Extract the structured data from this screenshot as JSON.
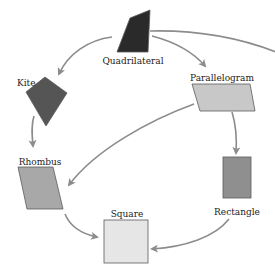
{
  "diagram": {
    "type": "quadrilateral-hierarchy",
    "colors": {
      "quadrilateral": "#2a2a2a",
      "kite": "#555555",
      "parallelogram": "#c8c8c8",
      "rhombus": "#a8a8a8",
      "rectangle": "#8f8f8f",
      "square": "#e6e6e6",
      "arrow": "#8c8c8c"
    },
    "nodes": {
      "quadrilateral": {
        "label": "Quadrilateral"
      },
      "kite": {
        "label": "Kite"
      },
      "parallelogram": {
        "label": "Parallelogram"
      },
      "rhombus": {
        "label": "Rhombus"
      },
      "rectangle": {
        "label": "Rectangle"
      },
      "square": {
        "label": "Square"
      }
    },
    "edges": [
      {
        "from": "Quadrilateral",
        "to": "Kite"
      },
      {
        "from": "Quadrilateral",
        "to": "Parallelogram"
      },
      {
        "from": "Quadrilateral",
        "to": "(off-canvas right)"
      },
      {
        "from": "Kite",
        "to": "Rhombus"
      },
      {
        "from": "Parallelogram",
        "to": "Rhombus"
      },
      {
        "from": "Parallelogram",
        "to": "Rectangle"
      },
      {
        "from": "Rhombus",
        "to": "Square"
      },
      {
        "from": "Rectangle",
        "to": "Square"
      }
    ]
  }
}
